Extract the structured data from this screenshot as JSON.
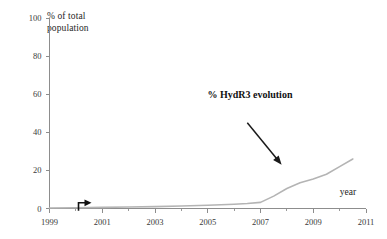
{
  "chart_data": {
    "type": "line",
    "title": "",
    "xlabel": "year",
    "ylabel": "% of total population",
    "ylabel_line1": "% of total",
    "ylabel_line2": "population",
    "xlim": [
      1999,
      2011
    ],
    "ylim": [
      0,
      100
    ],
    "xticks": [
      1999,
      2001,
      2003,
      2005,
      2007,
      2009,
      2011
    ],
    "xtick_labels": [
      "1999",
      "2001",
      "2003",
      "2005",
      "2007",
      "2009",
      "2011"
    ],
    "xminor_ticks": [
      2000,
      2002,
      2004,
      2006,
      2008,
      2010
    ],
    "yticks": [
      0,
      20,
      40,
      60,
      80,
      100
    ],
    "ytick_labels": [
      "0",
      "20",
      "40",
      "60",
      "80",
      "100"
    ],
    "grid": false,
    "legend": "none",
    "series": [
      {
        "name": "% HydR3 evolution",
        "color": "#b4b4b4",
        "x": [
          1999,
          2000,
          2001,
          2002,
          2003,
          2004,
          2005,
          2006,
          2006.5,
          2007,
          2007.5,
          2008,
          2008.5,
          2009,
          2009.5,
          2010,
          2010.5
        ],
        "values": [
          0.3,
          0.4,
          0.6,
          0.8,
          1.0,
          1.3,
          1.7,
          2.2,
          2.6,
          3.2,
          6.5,
          10.5,
          13.5,
          15.5,
          18.0,
          22.0,
          26.0
        ]
      }
    ],
    "annotations": [
      {
        "name": "series-callout",
        "text": "% HydR3 evolution",
        "text_x": 2006.6,
        "text_y": 58,
        "arrow_from_x": 2006.5,
        "arrow_from_y": 45,
        "arrow_to_x": 2007.8,
        "arrow_to_y": 23
      },
      {
        "name": "start-marker",
        "text": "",
        "x": 2000.1,
        "y": 3
      }
    ]
  },
  "axis": {
    "year_label": "year",
    "y_caption_line1": "% of total",
    "y_caption_line2": "population"
  },
  "colors": {
    "series": "#b4b4b4",
    "axis": "#8d8d8d",
    "annotation": "#111111",
    "background": "#ffffff"
  }
}
